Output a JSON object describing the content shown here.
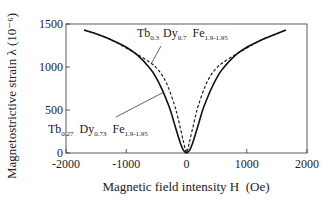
{
  "chart_data": {
    "type": "line",
    "title": "",
    "xlabel": "Magnetic field intensity H  (Oe)",
    "ylabel": "Magnetostrictive strain λ (10⁻⁶)",
    "xlim": [
      -2000,
      2000
    ],
    "ylim": [
      0,
      1500
    ],
    "xticks": [
      -2000,
      -1000,
      0,
      1000,
      2000
    ],
    "yticks": [
      0,
      500,
      1000,
      1500
    ],
    "xtick_labels": [
      "-2000",
      "-1000",
      "0",
      "1000",
      "2000"
    ],
    "ytick_labels": [
      "0",
      "500",
      "1000",
      "1500"
    ],
    "grid": false,
    "series": [
      {
        "name": "Tb0.27 Dy0.73 Fe1.9-1.95",
        "style": "solid",
        "x": [
          -1700,
          -1400,
          -1200,
          -1000,
          -800,
          -600,
          -500,
          -400,
          -300,
          -250,
          -200,
          -150,
          -100,
          -50,
          0,
          50,
          100,
          150,
          200,
          250,
          300,
          400,
          500,
          600,
          800,
          1000,
          1200,
          1400,
          1650
        ],
        "y": [
          1430,
          1360,
          1300,
          1230,
          1130,
          980,
          870,
          730,
          560,
          460,
          340,
          220,
          110,
          30,
          0,
          30,
          110,
          220,
          340,
          460,
          560,
          730,
          870,
          980,
          1130,
          1230,
          1300,
          1360,
          1430
        ]
      },
      {
        "name": "Tb0.3 Dy0.7 Fe1.9-1.95",
        "style": "dashed",
        "x": [
          -1700,
          -1400,
          -1200,
          -1000,
          -800,
          -600,
          -500,
          -400,
          -300,
          -200,
          -150,
          -100,
          -50,
          0,
          50,
          100,
          150,
          200,
          300,
          400,
          500,
          600,
          800,
          1000,
          1200,
          1400,
          1650
        ],
        "y": [
          1430,
          1360,
          1300,
          1220,
          1140,
          1050,
          990,
          900,
          760,
          560,
          430,
          280,
          130,
          0,
          130,
          280,
          430,
          560,
          760,
          900,
          990,
          1050,
          1140,
          1220,
          1300,
          1360,
          1430
        ]
      }
    ],
    "annotations": [
      {
        "text": "Tb0.3 Dy0.7 Fe1.9-1.95",
        "points_to": "dashed"
      },
      {
        "text": "Tb0.27 Dy0.73 Fe1.9-1.95",
        "points_to": "solid"
      }
    ]
  },
  "labels": {
    "ann_top": {
      "tb": "Tb",
      "tb_sub": "0.3",
      "dy": "Dy",
      "dy_sub": "0.7",
      "fe": "Fe",
      "fe_sub": "1.9-1.95"
    },
    "ann_bottom": {
      "tb": "Tb",
      "tb_sub": "0.27",
      "dy": "Dy",
      "dy_sub": "0.73",
      "fe": "Fe",
      "fe_sub": "1.9-1.95"
    }
  }
}
